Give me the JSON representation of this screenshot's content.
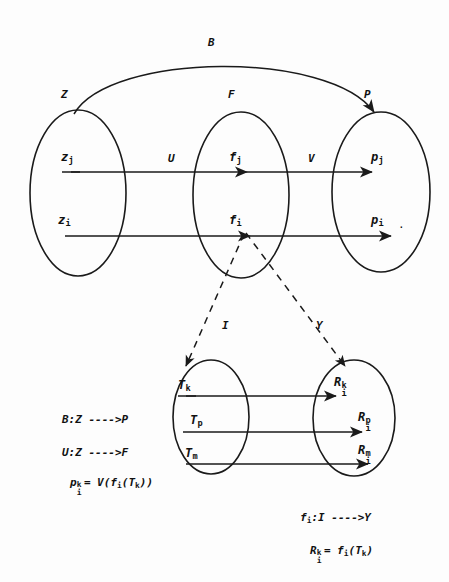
{
  "diagram": {
    "sets": {
      "top": [
        {
          "name": "set-z",
          "label": "Z"
        },
        {
          "name": "set-f",
          "label": "F"
        },
        {
          "name": "set-p",
          "label": "P"
        }
      ],
      "bottom": [
        {
          "name": "set-i",
          "label": "I"
        },
        {
          "name": "set-y",
          "label": "Y"
        }
      ]
    },
    "maps": {
      "arc_label": "B",
      "u_label": "U",
      "v_label": "V"
    },
    "elements": {
      "z_upper": {
        "base": "z",
        "sub": "j"
      },
      "z_lower": {
        "base": "z",
        "sub": "i"
      },
      "f_upper": {
        "base": "f",
        "sub": "j"
      },
      "f_lower": {
        "base": "f",
        "sub": "i"
      },
      "p_upper": {
        "base": "p",
        "sub": "j"
      },
      "p_lower": {
        "base": "p",
        "sub": "i"
      },
      "t_k": {
        "base": "T",
        "sub": "k"
      },
      "t_p": {
        "base": "T",
        "sub": "p"
      },
      "t_m": {
        "base": "T",
        "sub": "m"
      },
      "r_k": {
        "base": "R",
        "sub": "i",
        "sup": "k"
      },
      "r_p": {
        "base": "R",
        "sub": "i",
        "sup": "p"
      },
      "r_m": {
        "base": "R",
        "sub": "i",
        "sup": "m"
      }
    },
    "formulas_left": [
      {
        "name": "formula-b-map",
        "text": "B:Z ---->P"
      },
      {
        "name": "formula-u-map",
        "text": "U:Z ---->F"
      }
    ],
    "formula_p_def": {
      "lhs_base": "p",
      "lhs_sub": "i",
      "lhs_sup": "k",
      "rhs": "= V(f",
      "rhs_sub1": "i",
      "rhs_mid": "(T",
      "rhs_sub2": "k",
      "rhs_end": "))"
    },
    "formulas_right": [
      {
        "name": "formula-fi-map",
        "text": "f"
      }
    ],
    "formula_fi_map": {
      "base": "f",
      "sub": "i",
      "text": ":I ---->Y"
    },
    "formula_r_def": {
      "lhs_base": "R",
      "lhs_sub": "i",
      "lhs_sup": "k",
      "rhs": "= f",
      "rhs_sub1": "i",
      "rhs_mid": "(T",
      "rhs_sub2": "k",
      "rhs_end": ")"
    },
    "colors": {
      "ink": "#1a1a1a",
      "background": "#fdfdfd"
    },
    "trailing_dot": "."
  }
}
